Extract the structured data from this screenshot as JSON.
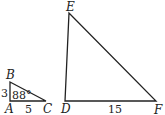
{
  "diagram": {
    "small_triangle": {
      "vertices": {
        "A": {
          "label": "A",
          "x": 10,
          "y": 101
        },
        "B": {
          "label": "B",
          "x": 10,
          "y": 82
        },
        "C": {
          "label": "C",
          "x": 46,
          "y": 101
        }
      },
      "side_AB": "3",
      "side_AC": "5",
      "angle_A": "88°"
    },
    "large_triangle": {
      "vertices": {
        "D": {
          "label": "D",
          "x": 65,
          "y": 101
        },
        "E": {
          "label": "E",
          "x": 69,
          "y": 13
        },
        "F": {
          "label": "F",
          "x": 156,
          "y": 101
        }
      },
      "side_DF": "15"
    },
    "colors": {
      "stroke": "#222222",
      "background": "#ffffff"
    }
  }
}
